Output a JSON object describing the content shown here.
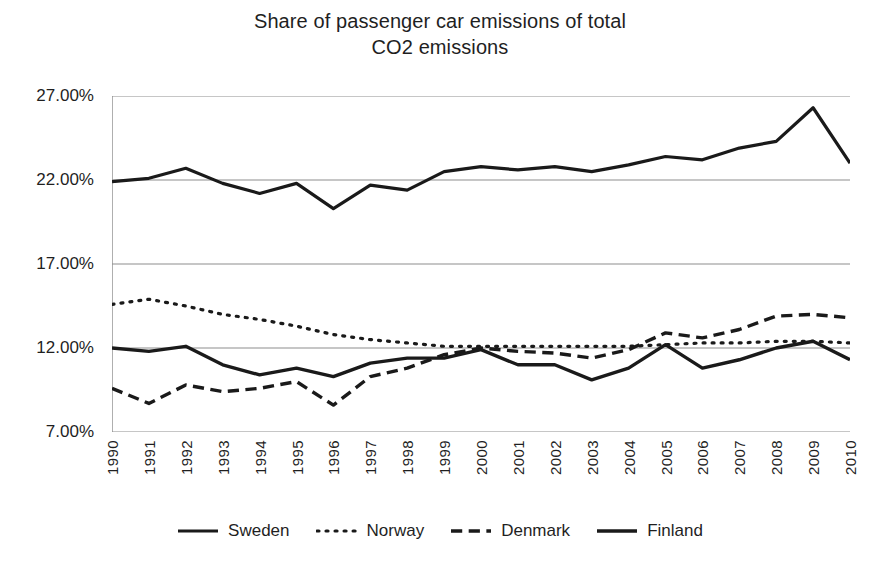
{
  "chart_data": {
    "type": "line",
    "title": "Share of passenger car emissions of total CO2 emissions",
    "title_lines": [
      "Share of passenger car emissions of total",
      "CO2 emissions"
    ],
    "xlabel": "",
    "ylabel": "",
    "ylim": [
      7,
      27
    ],
    "yticks": [
      7,
      12,
      17,
      22,
      27
    ],
    "ytick_labels": [
      "7.00%",
      "12.00%",
      "17.00%",
      "22.00%",
      "27.00%"
    ],
    "grid": "horizontal",
    "legend_position": "bottom",
    "x": [
      1990,
      1991,
      1992,
      1993,
      1994,
      1995,
      1996,
      1997,
      1998,
      1999,
      2000,
      2001,
      2002,
      2003,
      2004,
      2005,
      2006,
      2007,
      2008,
      2009,
      2010
    ],
    "categories": [
      "1990",
      "1991",
      "1992",
      "1993",
      "1994",
      "1995",
      "1996",
      "1997",
      "1998",
      "1999",
      "2000",
      "2001",
      "2002",
      "2003",
      "2004",
      "2005",
      "2006",
      "2007",
      "2008",
      "2009",
      "2010"
    ],
    "series": [
      {
        "name": "Sweden",
        "style": "solid",
        "color": "#1a1a1a",
        "width": 3.2,
        "values": [
          21.9,
          22.1,
          22.7,
          21.8,
          21.2,
          21.8,
          20.3,
          21.7,
          21.4,
          22.5,
          22.8,
          22.6,
          22.8,
          22.5,
          22.9,
          23.4,
          23.2,
          23.9,
          24.3,
          26.3,
          23.0
        ]
      },
      {
        "name": "Norway",
        "style": "dotted",
        "color": "#1a1a1a",
        "width": 3.2,
        "values": [
          14.6,
          14.9,
          14.5,
          14.0,
          13.7,
          13.3,
          12.8,
          12.5,
          12.3,
          12.1,
          12.1,
          12.1,
          12.1,
          12.1,
          12.1,
          12.2,
          12.3,
          12.3,
          12.4,
          12.4,
          12.3
        ]
      },
      {
        "name": "Denmark",
        "style": "dashed",
        "color": "#1a1a1a",
        "width": 3.4,
        "values": [
          9.6,
          8.7,
          9.8,
          9.4,
          9.6,
          10.0,
          8.6,
          10.3,
          10.8,
          11.6,
          12.0,
          11.8,
          11.7,
          11.4,
          11.9,
          12.9,
          12.6,
          13.1,
          13.9,
          14.0,
          13.8
        ]
      },
      {
        "name": "Finland",
        "style": "solid",
        "color": "#1a1a1a",
        "width": 3.4,
        "values": [
          12.0,
          11.8,
          12.1,
          11.0,
          10.4,
          10.8,
          10.3,
          11.1,
          11.4,
          11.4,
          11.9,
          11.0,
          11.0,
          10.1,
          10.8,
          12.2,
          10.8,
          11.3,
          12.0,
          12.4,
          11.3
        ]
      }
    ]
  },
  "legend": {
    "items": [
      {
        "label": "Sweden",
        "style": "solid"
      },
      {
        "label": "Norway",
        "style": "dotted"
      },
      {
        "label": "Denmark",
        "style": "dashed"
      },
      {
        "label": "Finland",
        "style": "solid"
      }
    ]
  }
}
